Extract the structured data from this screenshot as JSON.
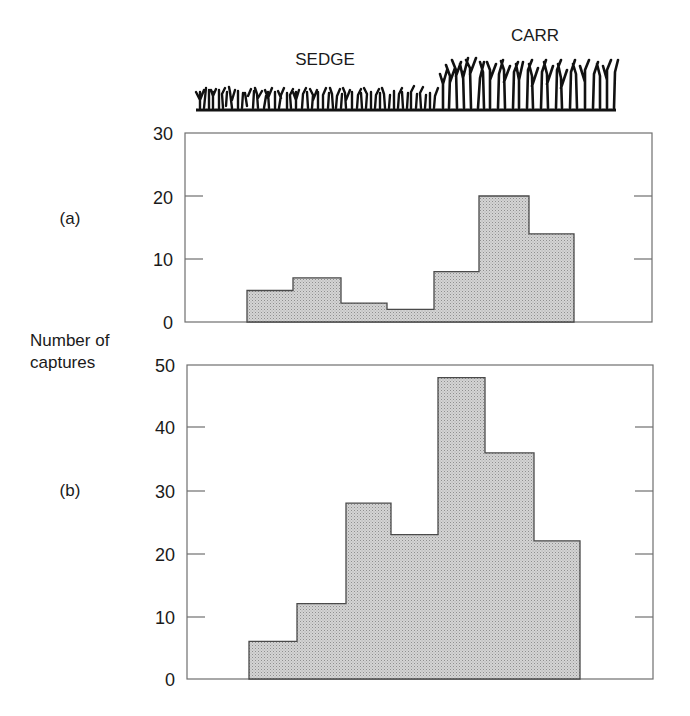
{
  "chart_data": [
    {
      "type": "bar",
      "panel": "(a)",
      "title": "",
      "xlabel": "",
      "ylabel": "Number of captures",
      "ylim": [
        0,
        30
      ],
      "yticks": [
        0,
        10,
        20,
        30
      ],
      "categories": [
        "bin1",
        "bin2",
        "bin3",
        "bin4",
        "bin5",
        "bin6",
        "bin7"
      ],
      "values": [
        5,
        7,
        3,
        2,
        8,
        20,
        14
      ],
      "grid": false,
      "style": "histogram-step"
    },
    {
      "type": "bar",
      "panel": "(b)",
      "title": "",
      "xlabel": "",
      "ylabel": "Number of captures",
      "ylim": [
        0,
        50
      ],
      "yticks": [
        0,
        10,
        20,
        30,
        40,
        50
      ],
      "categories": [
        "bin1",
        "bin2",
        "bin3",
        "bin4",
        "bin5",
        "bin6",
        "bin7"
      ],
      "values": [
        6,
        12,
        28,
        23,
        48,
        36,
        22
      ],
      "grid": false,
      "style": "histogram-step"
    }
  ],
  "header": {
    "habitat_labels": [
      "SEDGE",
      "CARR"
    ]
  },
  "panels": {
    "a": {
      "label": "(a)",
      "ticks": [
        "30",
        "20",
        "10",
        "0"
      ]
    },
    "b": {
      "label": "(b)",
      "ticks": [
        "50",
        "40",
        "30",
        "20",
        "10",
        "0"
      ]
    }
  },
  "ylabel_lines": [
    "Number of",
    "captures"
  ],
  "colors": {
    "bar_fill": "#c6c6c6",
    "bar_stroke": "#4a4a4a",
    "frame": "#6f6f6f"
  }
}
